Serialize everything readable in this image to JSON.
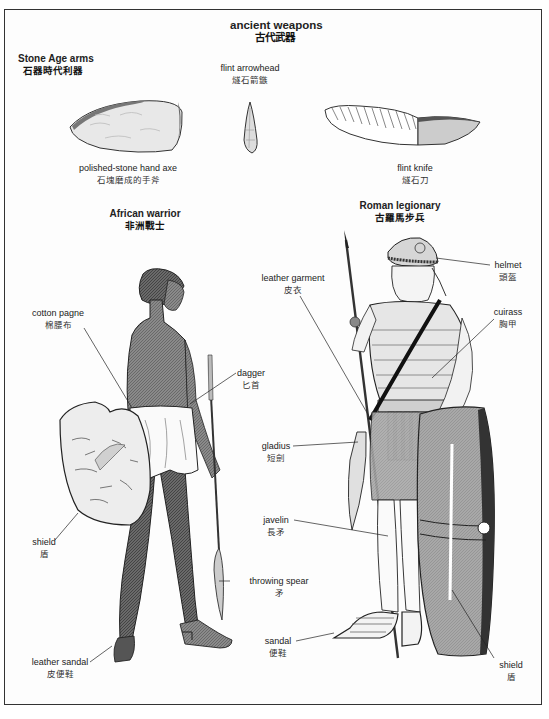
{
  "title": {
    "en": "ancient weapons",
    "zh": "古代武器"
  },
  "sections": {
    "stone_age": {
      "heading": {
        "en": "Stone Age arms",
        "zh": "石器時代利器"
      },
      "items": [
        {
          "en": "polished-stone hand axe",
          "zh": "石塊磨成的手斧"
        },
        {
          "en": "flint arrowhead",
          "zh": "燧石箭鏃"
        },
        {
          "en": "flint knife",
          "zh": "燧石刀"
        }
      ]
    },
    "african_warrior": {
      "heading": {
        "en": "African warrior",
        "zh": "非洲戰士"
      },
      "labels": [
        {
          "en": "cotton pagne",
          "zh": "棉腰布"
        },
        {
          "en": "dagger",
          "zh": "匕首"
        },
        {
          "en": "shield",
          "zh": "盾"
        },
        {
          "en": "throwing spear",
          "zh": "矛"
        },
        {
          "en": "leather sandal",
          "zh": "皮便鞋"
        }
      ]
    },
    "roman_legionary": {
      "heading": {
        "en": "Roman legionary",
        "zh": "古羅馬步兵"
      },
      "labels": [
        {
          "en": "helmet",
          "zh": "頭盔"
        },
        {
          "en": "leather garment",
          "zh": "皮衣"
        },
        {
          "en": "cuirass",
          "zh": "胸甲"
        },
        {
          "en": "gladius",
          "zh": "短劍"
        },
        {
          "en": "javelin",
          "zh": "長矛"
        },
        {
          "en": "sandal",
          "zh": "便鞋"
        },
        {
          "en": "shield",
          "zh": "盾"
        }
      ]
    }
  },
  "colors": {
    "ink": "#1a1a1a",
    "skin_dark": "#6a6a6a",
    "shade": "#9a9a9a",
    "light": "#e4e4e4",
    "frame": "#333333"
  }
}
